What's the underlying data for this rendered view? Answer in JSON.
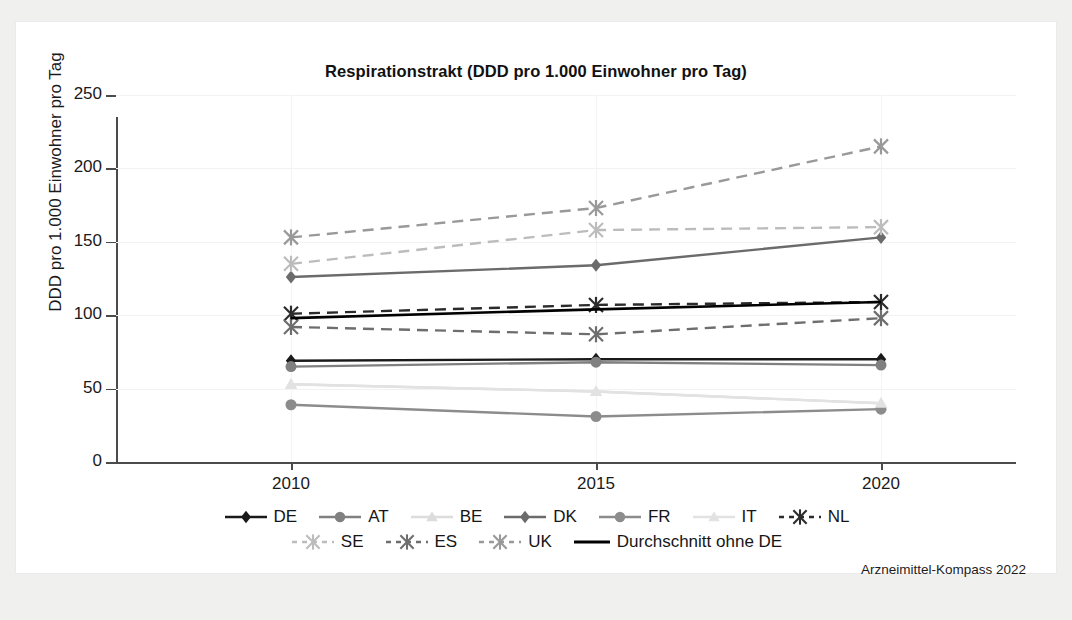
{
  "chart_data": {
    "type": "line",
    "title": "Respirationstrakt (DDD pro 1.000 Einwohner pro Tag)",
    "xlabel": "",
    "ylabel": "DDD pro 1.000 Einwohner pro Tag",
    "x": [
      "2010",
      "2015",
      "2020"
    ],
    "categories": [
      "2010",
      "2015",
      "2020"
    ],
    "ylim": [
      0,
      250
    ],
    "yticks": [
      0,
      50,
      100,
      150,
      200,
      250
    ],
    "ytick_labels": [
      "0",
      "50",
      "100",
      "150",
      "200",
      "250"
    ],
    "grid": true,
    "legend_position": "bottom",
    "source": "Arzneimittel-Kompass 2022",
    "series": [
      {
        "name": "DE",
        "values": [
          69,
          70,
          70
        ],
        "color": "#1a1a1a",
        "marker": "diamond",
        "dash": "solid"
      },
      {
        "name": "AT",
        "values": [
          65,
          68,
          66
        ],
        "color": "#808080",
        "marker": "circle",
        "dash": "solid"
      },
      {
        "name": "BE",
        "values": [
          53,
          48,
          40
        ],
        "color": "#dcdcdc",
        "marker": "triangle",
        "dash": "solid"
      },
      {
        "name": "DK",
        "values": [
          126,
          134,
          153
        ],
        "color": "#6b6b6b",
        "marker": "diamond",
        "dash": "solid"
      },
      {
        "name": "FR",
        "values": [
          39,
          31,
          36
        ],
        "color": "#8c8c8c",
        "marker": "circle",
        "dash": "solid"
      },
      {
        "name": "IT",
        "values": [
          53,
          48,
          40
        ],
        "color": "#e2e2e2",
        "marker": "triangle",
        "dash": "solid"
      },
      {
        "name": "NL",
        "values": [
          101,
          107,
          109
        ],
        "color": "#2b2b2b",
        "marker": "x",
        "dash": "dashed"
      },
      {
        "name": "SE",
        "values": [
          135,
          158,
          160
        ],
        "color": "#bcbcbc",
        "marker": "x",
        "dash": "dashed"
      },
      {
        "name": "ES",
        "values": [
          92,
          87,
          98
        ],
        "color": "#6e6e6e",
        "marker": "x",
        "dash": "dashed"
      },
      {
        "name": "UK",
        "values": [
          153,
          173,
          215
        ],
        "color": "#999999",
        "marker": "x",
        "dash": "dashed"
      },
      {
        "name": "Durchschnitt ohne DE",
        "values": [
          98,
          104,
          109
        ],
        "color": "#000000",
        "marker": "none",
        "dash": "solid"
      }
    ]
  },
  "legend": {
    "rows": [
      [
        "DE",
        "AT",
        "BE",
        "DK",
        "FR",
        "IT",
        "NL"
      ],
      [
        "SE",
        "ES",
        "UK",
        "Durchschnitt ohne DE"
      ]
    ]
  }
}
